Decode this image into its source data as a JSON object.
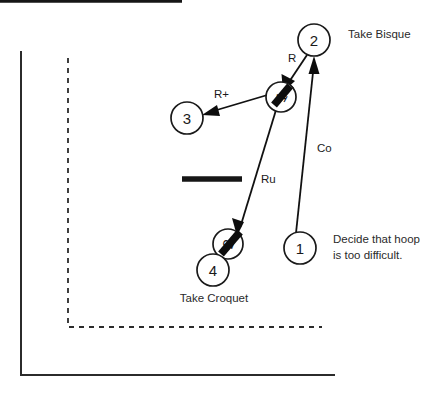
{
  "diagram": {
    "colors": {
      "ink": "#1a1a1a",
      "boundary": "#2b2b2b",
      "background": "#ffffff"
    },
    "balls": [
      {
        "id": "ball-2-top",
        "label": "2",
        "cx": 314,
        "cy": 40,
        "r": 16,
        "rotated": false
      },
      {
        "id": "ball-1-middle",
        "label": "1",
        "cx": 281,
        "cy": 97,
        "r": 15,
        "rotated": true
      },
      {
        "id": "ball-3",
        "label": "3",
        "cx": 187,
        "cy": 118,
        "r": 16,
        "rotated": false
      },
      {
        "id": "ball-2-lower",
        "label": "2",
        "cx": 228,
        "cy": 244,
        "r": 15,
        "rotated": true
      },
      {
        "id": "ball-4",
        "label": "4",
        "cx": 213,
        "cy": 270,
        "r": 16,
        "rotated": false
      },
      {
        "id": "ball-1-bottom",
        "label": "1",
        "cx": 300,
        "cy": 248,
        "r": 16,
        "rotated": false
      }
    ],
    "stroke_labels": [
      {
        "id": "label-R",
        "text": "R",
        "x": 288,
        "y": 62
      },
      {
        "id": "label-Rplus",
        "text": "R+",
        "x": 214,
        "y": 98
      },
      {
        "id": "label-Ru",
        "text": "Ru",
        "x": 261,
        "y": 183
      },
      {
        "id": "label-Co",
        "text": "Co",
        "x": 317,
        "y": 152
      }
    ],
    "annotations": [
      {
        "id": "annotation-take-bisque",
        "lines": [
          "Take Bisque"
        ],
        "x": 348,
        "y": 38,
        "align": "start"
      },
      {
        "id": "annotation-decide-hoop",
        "lines": [
          "Decide that hoop",
          "is  too  difficult."
        ],
        "x": 333,
        "y": 243,
        "align": "start"
      },
      {
        "id": "annotation-take-croquet",
        "lines": [
          "Take Croquet"
        ],
        "x": 214,
        "y": 302,
        "align": "middle"
      }
    ],
    "hoop": {
      "id": "hoop-bar",
      "x1": 182,
      "y1": 179,
      "x2": 242,
      "y2": 179
    },
    "boundary_solid": {
      "id": "court-boundary-solid",
      "points": "21,51 21,375 335,375"
    },
    "boundary_dashed": {
      "id": "court-boundary-dashed",
      "points": "68,58 68,327 322,327"
    }
  }
}
